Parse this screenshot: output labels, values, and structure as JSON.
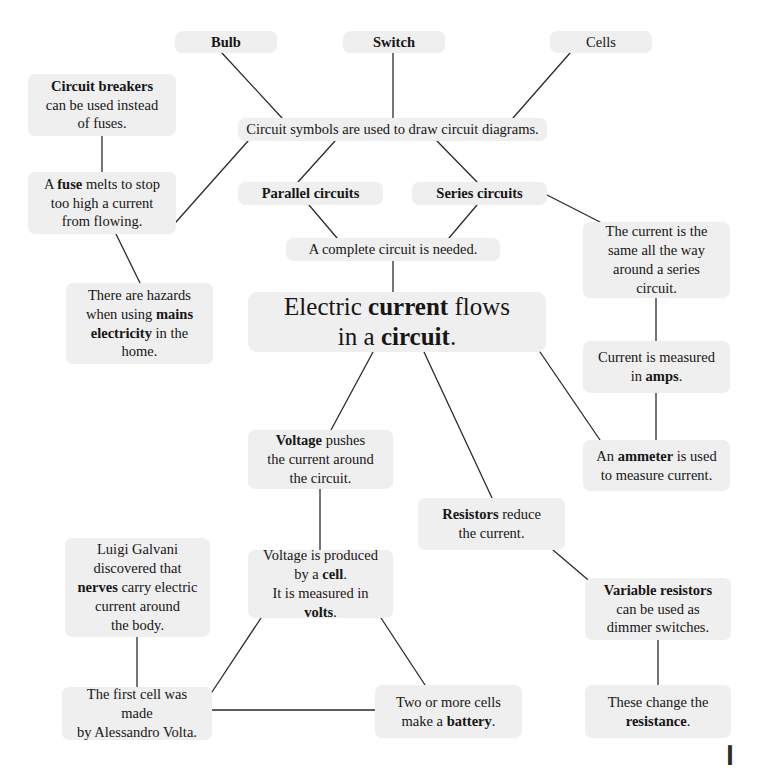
{
  "diagram": {
    "colors": {
      "page_background": "#ffffff",
      "node_fill": "#efefef",
      "text": "#161616",
      "edge_stroke": "#2a2a2a"
    },
    "corner_mark": "❙"
  },
  "nodes": [
    {
      "id": "bulb",
      "name": "node-bulb",
      "text": "Bulb",
      "html": "<b>Bulb</b>",
      "x": 175,
      "y": 31,
      "w": 102,
      "h": 22,
      "font_size": 14.5,
      "bold": true
    },
    {
      "id": "switch",
      "name": "node-switch",
      "text": "Switch",
      "html": "<b>Switch</b>",
      "x": 343,
      "y": 31,
      "w": 102,
      "h": 22,
      "font_size": 14.5,
      "bold": true
    },
    {
      "id": "cells",
      "name": "node-cells",
      "text": "Cells",
      "html": "Cells",
      "x": 550,
      "y": 31,
      "w": 102,
      "h": 22,
      "font_size": 14.5,
      "bold": false
    },
    {
      "id": "circuit-breakers",
      "name": "node-circuit-breakers",
      "text": "Circuit breakers can be used instead of fuses.",
      "html": "<b>Circuit breakers</b><br>can be used instead<br>of fuses.",
      "x": 28,
      "y": 74,
      "w": 148,
      "h": 62,
      "font_size": 14.5
    },
    {
      "id": "circuit-symbols",
      "name": "node-circuit-symbols",
      "text": "Circuit symbols are used to draw circuit diagrams.",
      "html": "Circuit symbols are used to draw circuit diagrams.",
      "x": 238,
      "y": 118,
      "w": 309,
      "h": 23,
      "font_size": 14.5
    },
    {
      "id": "fuse",
      "name": "node-fuse",
      "text": "A fuse melts to stop too high a current from flowing.",
      "html": "A <b>fuse</b> melts to stop<br>too high a current<br>from flowing.",
      "x": 28,
      "y": 172,
      "w": 148,
      "h": 62,
      "font_size": 14.5
    },
    {
      "id": "parallel-circuits",
      "name": "node-parallel-circuits",
      "text": "Parallel circuits",
      "html": "<b>Parallel circuits</b>",
      "x": 238,
      "y": 182,
      "w": 145,
      "h": 23,
      "font_size": 14.5,
      "bold": true
    },
    {
      "id": "series-circuits",
      "name": "node-series-circuits",
      "text": "Series circuits",
      "html": "<b>Series circuits</b>",
      "x": 412,
      "y": 182,
      "w": 135,
      "h": 23,
      "font_size": 14.5,
      "bold": true
    },
    {
      "id": "current-same",
      "name": "node-current-same-series",
      "text": "The current is the same all the way around a series circuit.",
      "html": "The current is the<br>same all the way<br>around a series circuit.",
      "x": 583,
      "y": 222,
      "w": 147,
      "h": 76,
      "font_size": 14.5
    },
    {
      "id": "complete-circuit",
      "name": "node-complete-circuit",
      "text": "A complete circuit is needed.",
      "html": "A complete circuit is needed.",
      "x": 286,
      "y": 238,
      "w": 214,
      "h": 23,
      "font_size": 14.5
    },
    {
      "id": "hazards",
      "name": "node-mains-hazards",
      "text": "There are hazards when using mains electricity in the home.",
      "html": "There are hazards<br>when using <b>mains</b><br><b>electricity</b> in the home.",
      "x": 66,
      "y": 283,
      "w": 147,
      "h": 81,
      "font_size": 14.5
    },
    {
      "id": "central",
      "name": "node-central-electric-current",
      "text": "Electric current flows in a circuit.",
      "html": "Electric <b>current</b> flows<br>in a <b>circuit</b>.",
      "x": 248,
      "y": 292,
      "w": 298,
      "h": 60,
      "font_size": 25,
      "central": true
    },
    {
      "id": "current-amps",
      "name": "node-current-measured-amps",
      "text": "Current is measured in amps.",
      "html": "Current is measured<br>in <b>amps</b>.",
      "x": 583,
      "y": 341,
      "w": 147,
      "h": 52,
      "font_size": 14.5
    },
    {
      "id": "voltage-pushes",
      "name": "node-voltage-pushes",
      "text": "Voltage pushes the current around the circuit.",
      "html": "<b>Voltage</b> pushes<br>the current around<br>the circuit.",
      "x": 248,
      "y": 430,
      "w": 145,
      "h": 59,
      "font_size": 14.5
    },
    {
      "id": "ammeter",
      "name": "node-ammeter",
      "text": "An ammeter is used to measure current.",
      "html": "An <b>ammeter</b> is used<br>to measure current.",
      "x": 583,
      "y": 440,
      "w": 147,
      "h": 51,
      "font_size": 14.5
    },
    {
      "id": "resistors",
      "name": "node-resistors",
      "text": "Resistors reduce the current.",
      "html": "<b>Resistors</b> reduce<br>the current.",
      "x": 418,
      "y": 498,
      "w": 147,
      "h": 52,
      "font_size": 14.5
    },
    {
      "id": "galvani",
      "name": "node-luigi-galvani",
      "text": "Luigi Galvani discovered that nerves carry electric current around the body.",
      "html": "Luigi Galvani<br>discovered that<br><b>nerves</b> carry electric<br>current around<br>the body.",
      "x": 65,
      "y": 538,
      "w": 145,
      "h": 99,
      "font_size": 14.5
    },
    {
      "id": "voltage-cell",
      "name": "node-voltage-produced-by-cell",
      "text": "Voltage is produced by a cell. It is measured in volts.",
      "html": "Voltage is produced<br>by a <b>cell</b>.<br>It is measured in <b>volts</b>.",
      "x": 248,
      "y": 550,
      "w": 145,
      "h": 68,
      "font_size": 14.5
    },
    {
      "id": "variable-resistors",
      "name": "node-variable-resistors",
      "text": "Variable resistors can be used as dimmer switches.",
      "html": "<b>Variable resistors</b><br>can be used as<br>dimmer switches.",
      "x": 585,
      "y": 578,
      "w": 146,
      "h": 62,
      "font_size": 14.5
    },
    {
      "id": "first-cell",
      "name": "node-first-cell-volta",
      "text": "The first cell was made by Alessandro Volta.",
      "html": "The first cell was made<br>by Alessandro Volta.",
      "x": 62,
      "y": 687,
      "w": 150,
      "h": 53,
      "font_size": 14.5
    },
    {
      "id": "battery",
      "name": "node-two-or-more-cells-battery",
      "text": "Two or more cells make a battery.",
      "html": "Two or more cells<br>make a <b>battery</b>.",
      "x": 375,
      "y": 685,
      "w": 147,
      "h": 53,
      "font_size": 14.5
    },
    {
      "id": "resistance",
      "name": "node-these-change-resistance",
      "text": "These change the resistance.",
      "html": "These change the<br><b>resistance</b>.",
      "x": 585,
      "y": 685,
      "w": 146,
      "h": 53,
      "font_size": 14.5
    }
  ],
  "edges": [
    {
      "name": "edge-bulb-to-circuit-symbols",
      "from": "bulb",
      "to": "circuit-symbols",
      "x1": 222,
      "y1": 53,
      "x2": 282,
      "y2": 118
    },
    {
      "name": "edge-switch-to-circuit-symbols",
      "from": "switch",
      "to": "circuit-symbols",
      "x1": 393,
      "y1": 53,
      "x2": 393,
      "y2": 118
    },
    {
      "name": "edge-cells-to-circuit-symbols",
      "from": "cells",
      "to": "circuit-symbols",
      "x1": 570,
      "y1": 53,
      "x2": 513,
      "y2": 118
    },
    {
      "name": "edge-circuit-breakers-to-fuse",
      "from": "circuit-breakers",
      "to": "fuse",
      "x1": 102,
      "y1": 136,
      "x2": 102,
      "y2": 172
    },
    {
      "name": "edge-circuit-symbols-to-fuse",
      "from": "circuit-symbols",
      "to": "fuse",
      "x1": 248,
      "y1": 141,
      "x2": 176,
      "y2": 222
    },
    {
      "name": "edge-circuit-symbols-to-parallel",
      "from": "circuit-symbols",
      "to": "parallel-circuits",
      "x1": 335,
      "y1": 141,
      "x2": 298,
      "y2": 182
    },
    {
      "name": "edge-circuit-symbols-to-series",
      "from": "circuit-symbols",
      "to": "series-circuits",
      "x1": 437,
      "y1": 141,
      "x2": 477,
      "y2": 182
    },
    {
      "name": "edge-fuse-to-hazards",
      "from": "fuse",
      "to": "hazards",
      "x1": 116,
      "y1": 234,
      "x2": 140,
      "y2": 283
    },
    {
      "name": "edge-parallel-to-complete-circuit",
      "from": "parallel-circuits",
      "to": "complete-circuit",
      "x1": 309,
      "y1": 205,
      "x2": 337,
      "y2": 238
    },
    {
      "name": "edge-series-to-complete-circuit",
      "from": "series-circuits",
      "to": "complete-circuit",
      "x1": 477,
      "y1": 205,
      "x2": 449,
      "y2": 238
    },
    {
      "name": "edge-series-to-current-same",
      "from": "series-circuits",
      "to": "current-same",
      "x1": 547,
      "y1": 195,
      "x2": 600,
      "y2": 222
    },
    {
      "name": "edge-complete-circuit-to-central",
      "from": "complete-circuit",
      "to": "central",
      "x1": 393,
      "y1": 261,
      "x2": 393,
      "y2": 292
    },
    {
      "name": "edge-current-same-to-current-amps",
      "from": "current-same",
      "to": "current-amps",
      "x1": 656,
      "y1": 298,
      "x2": 656,
      "y2": 341
    },
    {
      "name": "edge-central-to-voltage-pushes",
      "from": "central",
      "to": "voltage-pushes",
      "x1": 373,
      "y1": 352,
      "x2": 331,
      "y2": 430
    },
    {
      "name": "edge-central-to-resistors",
      "from": "central",
      "to": "resistors",
      "x1": 424,
      "y1": 352,
      "x2": 492,
      "y2": 498
    },
    {
      "name": "edge-central-to-ammeter",
      "from": "central",
      "to": "ammeter",
      "x1": 540,
      "y1": 352,
      "x2": 600,
      "y2": 440
    },
    {
      "name": "edge-current-amps-to-ammeter",
      "from": "current-amps",
      "to": "ammeter",
      "x1": 656,
      "y1": 393,
      "x2": 656,
      "y2": 440
    },
    {
      "name": "edge-voltage-pushes-to-voltage-cell",
      "from": "voltage-pushes",
      "to": "voltage-cell",
      "x1": 320,
      "y1": 489,
      "x2": 320,
      "y2": 550
    },
    {
      "name": "edge-resistors-to-variable-resistors",
      "from": "resistors",
      "to": "variable-resistors",
      "x1": 553,
      "y1": 550,
      "x2": 600,
      "y2": 590
    },
    {
      "name": "edge-galvani-to-first-cell",
      "from": "galvani",
      "to": "first-cell",
      "x1": 137,
      "y1": 637,
      "x2": 137,
      "y2": 687
    },
    {
      "name": "edge-voltage-cell-to-first-cell",
      "from": "voltage-cell",
      "to": "first-cell",
      "x1": 261,
      "y1": 618,
      "x2": 212,
      "y2": 692
    },
    {
      "name": "edge-voltage-cell-to-battery",
      "from": "voltage-cell",
      "to": "battery",
      "x1": 381,
      "y1": 618,
      "x2": 425,
      "y2": 685
    },
    {
      "name": "edge-first-cell-to-battery",
      "from": "first-cell",
      "to": "battery",
      "x1": 212,
      "y1": 710,
      "x2": 375,
      "y2": 710
    },
    {
      "name": "edge-variable-resistors-to-resistance",
      "from": "variable-resistors",
      "to": "resistance",
      "x1": 658,
      "y1": 640,
      "x2": 658,
      "y2": 685
    }
  ]
}
